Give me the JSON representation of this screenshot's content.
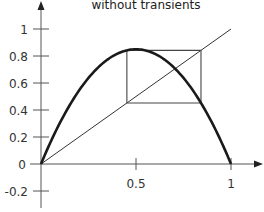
{
  "chart_data": {
    "type": "line",
    "title": "without transients",
    "xlabel": "",
    "ylabel": "",
    "xlim": [
      0,
      1.1
    ],
    "ylim": [
      -0.25,
      1.05
    ],
    "x_ticks": [
      0.5,
      1
    ],
    "x_tick_labels": [
      "0.5",
      "1"
    ],
    "y_ticks": [
      1,
      0.8,
      0.6,
      0.4,
      0.2,
      0,
      -0.2
    ],
    "y_tick_labels": [
      "1",
      "0.8",
      "0.6",
      "0.4",
      "0.2",
      "0",
      "-0.2"
    ],
    "grid": false,
    "legend": null,
    "series": [
      {
        "name": "logistic map f(x) = r x (1 - x)",
        "style": "thick",
        "r": 3.4,
        "x": [
          0,
          0.1,
          0.2,
          0.3,
          0.4,
          0.5,
          0.6,
          0.7,
          0.8,
          0.9,
          1.0
        ],
        "y": [
          0,
          0.306,
          0.544,
          0.714,
          0.816,
          0.85,
          0.816,
          0.714,
          0.544,
          0.306,
          0
        ]
      },
      {
        "name": "diagonal y = x",
        "style": "thin",
        "x": [
          0,
          1.0
        ],
        "y": [
          0,
          1.0
        ]
      },
      {
        "name": "cobweb 2-cycle (without transients)",
        "style": "thin",
        "x": [
          0.452,
          0.452,
          0.842,
          0.842,
          0.452
        ],
        "y": [
          0.452,
          0.842,
          0.842,
          0.452,
          0.452
        ]
      }
    ]
  }
}
